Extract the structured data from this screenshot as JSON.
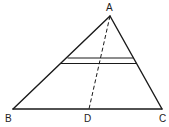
{
  "diagram": {
    "type": "geometry-triangle",
    "points": {
      "A": {
        "label": "A"
      },
      "B": {
        "label": "B"
      },
      "C": {
        "label": "C"
      },
      "D": {
        "label": "D"
      }
    },
    "segments": [
      {
        "from": "A",
        "to": "B",
        "style": "solid"
      },
      {
        "from": "A",
        "to": "C",
        "style": "solid"
      },
      {
        "from": "B",
        "to": "C",
        "style": "solid"
      },
      {
        "from": "A",
        "to": "D",
        "style": "dashed"
      }
    ],
    "parallel_lines_count": 2,
    "colors": {
      "stroke": "#1a1a1a",
      "background": "#ffffff"
    }
  }
}
